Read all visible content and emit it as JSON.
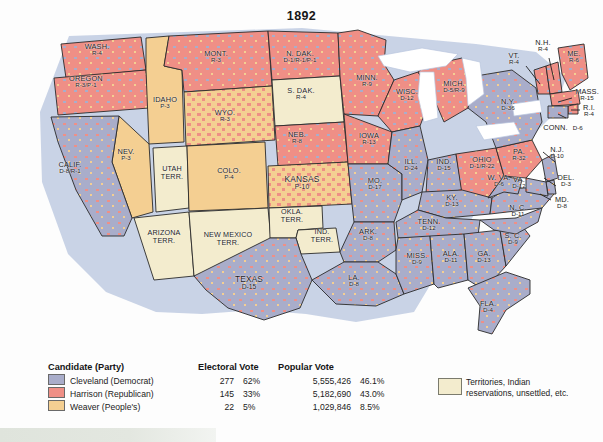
{
  "title": "1892",
  "colors": {
    "democrat": "#a9adca",
    "republican": "#ef8f86",
    "peoples": "#f4cf92",
    "territory": "#f3ecce",
    "lake": "#ffffff",
    "coast": "#8c9dc4",
    "border": "#2a2a2a",
    "background": "#fdfdfd"
  },
  "legend": {
    "headers": {
      "candidate": "Candidate (Party)",
      "electoral": "Electoral Vote",
      "popular": "Popular Vote"
    },
    "rows": [
      {
        "swatch": "democrat",
        "candidate": "Cleveland (Democrat)",
        "electoral_vote": "277",
        "electoral_pct": "62%",
        "popular_vote": "5,555,426",
        "popular_pct": "46.1%"
      },
      {
        "swatch": "republican",
        "candidate": "Harrison (Republican)",
        "electoral_vote": "145",
        "electoral_pct": "33%",
        "popular_vote": "5,182,690",
        "popular_pct": "43.0%"
      },
      {
        "swatch": "peoples",
        "candidate": "Weaver (People's)",
        "electoral_vote": "22",
        "electoral_pct": "5%",
        "popular_vote": "1,029,846",
        "popular_pct": "8.5%"
      }
    ],
    "territory_key": {
      "line1": "Territories, Indian",
      "line2": "reservations, unsettled, etc."
    }
  },
  "states": [
    {
      "name": "WASH.",
      "votes": "R-4"
    },
    {
      "name": "OREGON",
      "votes": "R-3/P-1"
    },
    {
      "name": "IDAHO",
      "votes": "P-3"
    },
    {
      "name": "MONT.",
      "votes": "R-3"
    },
    {
      "name": "WYO.",
      "votes": "R-3"
    },
    {
      "name": "NEV.",
      "votes": "P-3"
    },
    {
      "name": "CALIF.",
      "votes": "D-8/R-1"
    },
    {
      "name": "UTAH",
      "votes": "TERR."
    },
    {
      "name": "COLO.",
      "votes": "P-4"
    },
    {
      "name": "ARIZONA",
      "votes": "TERR."
    },
    {
      "name": "NEW MEXICO",
      "votes": "TERR."
    },
    {
      "name": "N. DAK.",
      "votes": "D-1/R-1/P-1"
    },
    {
      "name": "S. DAK.",
      "votes": "R-4"
    },
    {
      "name": "NEB.",
      "votes": "R-8"
    },
    {
      "name": "KANSAS",
      "votes": "P-10"
    },
    {
      "name": "OKLA.",
      "votes": "TERR."
    },
    {
      "name": "IND.",
      "votes": "TERR."
    },
    {
      "name": "TEXAS",
      "votes": "D-15"
    },
    {
      "name": "MINN.",
      "votes": "R-9"
    },
    {
      "name": "IOWA",
      "votes": "R-13"
    },
    {
      "name": "MO.",
      "votes": "D-17"
    },
    {
      "name": "ARK.",
      "votes": "D-8"
    },
    {
      "name": "LA.",
      "votes": "D-8"
    },
    {
      "name": "WISC.",
      "votes": "D-12"
    },
    {
      "name": "ILL.",
      "votes": "D-24"
    },
    {
      "name": "MICH.",
      "votes": "D-5/R-9"
    },
    {
      "name": "IND.",
      "votes": "D-15"
    },
    {
      "name": "OHIO",
      "votes": "D-1/R-22"
    },
    {
      "name": "KY.",
      "votes": "D-13"
    },
    {
      "name": "TENN.",
      "votes": "D-12"
    },
    {
      "name": "MISS.",
      "votes": "D-9"
    },
    {
      "name": "ALA.",
      "votes": "D-11"
    },
    {
      "name": "GA.",
      "votes": "D-13"
    },
    {
      "name": "FLA.",
      "votes": "D-4"
    },
    {
      "name": "S. C.",
      "votes": "D-9"
    },
    {
      "name": "N. C.",
      "votes": "D-11"
    },
    {
      "name": "VA.",
      "votes": "D-12"
    },
    {
      "name": "W. VA.",
      "votes": "D-6"
    },
    {
      "name": "PA.",
      "votes": "R-32"
    },
    {
      "name": "N.Y.",
      "votes": "D-36"
    },
    {
      "name": "VT.",
      "votes": "R-4"
    },
    {
      "name": "N.H.",
      "votes": "R-4"
    },
    {
      "name": "ME.",
      "votes": "R-6"
    },
    {
      "name": "MASS.",
      "votes": "R-15"
    },
    {
      "name": "R.I.",
      "votes": "R-4"
    },
    {
      "name": "CONN.",
      "votes": "D-6"
    },
    {
      "name": "N.J.",
      "votes": "D-10"
    },
    {
      "name": "DEL.",
      "votes": "D-3"
    },
    {
      "name": "MD.",
      "votes": "D-8"
    }
  ]
}
